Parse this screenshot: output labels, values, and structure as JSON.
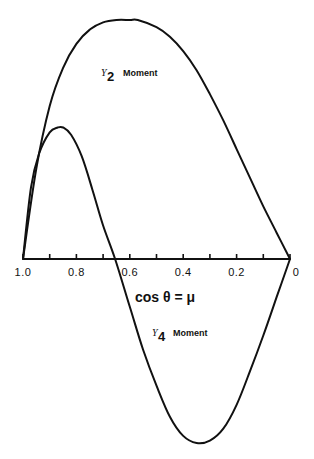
{
  "chart_data": {
    "type": "line",
    "title": "",
    "xlabel": "cos θ = μ",
    "ylabel": "",
    "xlim": [
      1.0,
      0.0
    ],
    "x_reversed": true,
    "grid": false,
    "legend": "inline labels",
    "x_ticks": [
      1.0,
      0.9,
      0.8,
      0.7,
      0.6,
      0.5,
      0.4,
      0.3,
      0.2,
      0.1,
      0.0
    ],
    "x_tick_labels": [
      {
        "value": 1.0,
        "label": "1.0"
      },
      {
        "value": 0.8,
        "label": "0.8"
      },
      {
        "value": 0.6,
        "label": "0.6"
      },
      {
        "value": 0.4,
        "label": "0.4"
      },
      {
        "value": 0.2,
        "label": "0.2"
      },
      {
        "value": 0.0,
        "label": "0"
      }
    ],
    "series": [
      {
        "name": "Y2 Moment",
        "label_prefix": "Y",
        "label_sub": "2",
        "label_text": "Moment",
        "x": [
          1.0,
          0.95,
          0.9,
          0.85,
          0.8,
          0.75,
          0.7,
          0.65,
          0.6,
          0.57,
          0.5,
          0.45,
          0.4,
          0.35,
          0.3,
          0.25,
          0.2,
          0.15,
          0.1,
          0.05,
          0.0
        ],
        "values": [
          0,
          0.38,
          0.64,
          0.8,
          0.9,
          0.96,
          0.99,
          1.0,
          1.0,
          1.0,
          0.97,
          0.93,
          0.87,
          0.79,
          0.69,
          0.58,
          0.46,
          0.34,
          0.22,
          0.11,
          0
        ]
      },
      {
        "name": "Y4 Moment",
        "label_prefix": "Y",
        "label_sub": "4",
        "label_text": "Moment",
        "x": [
          1.0,
          0.97,
          0.94,
          0.9,
          0.87,
          0.85,
          0.82,
          0.78,
          0.74,
          0.7,
          0.655,
          0.6,
          0.55,
          0.5,
          0.45,
          0.4,
          0.35,
          0.3,
          0.25,
          0.2,
          0.15,
          0.1,
          0.05,
          0.0
        ],
        "values": [
          0,
          0.3,
          0.44,
          0.53,
          0.55,
          0.55,
          0.52,
          0.43,
          0.29,
          0.14,
          0,
          -0.2,
          -0.38,
          -0.53,
          -0.66,
          -0.74,
          -0.77,
          -0.76,
          -0.71,
          -0.61,
          -0.47,
          -0.32,
          -0.16,
          0
        ]
      }
    ]
  },
  "labels": {
    "xlabel": "cos θ = μ",
    "y2_prefix": "Y",
    "y2_sub": "2",
    "y2_text": "Moment",
    "y4_prefix": "Y",
    "y4_sub": "4",
    "y4_text": "Moment"
  },
  "layout": {
    "x_left_px": 23,
    "x_right_px": 290,
    "axis_y_px": 259,
    "unit_px": 239
  }
}
